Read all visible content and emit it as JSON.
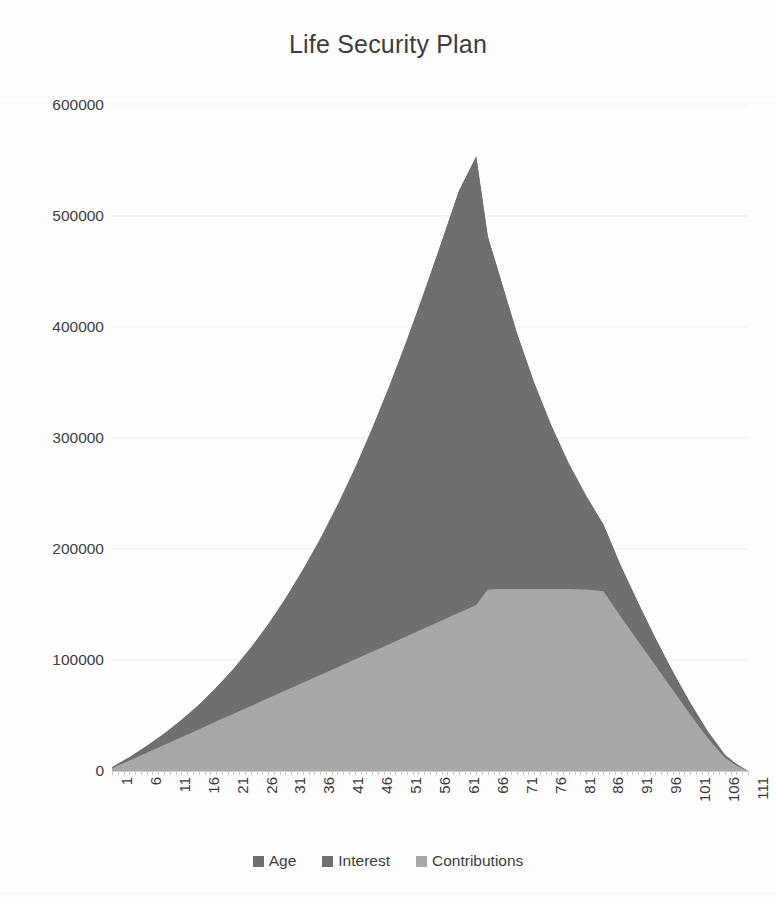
{
  "chart_data": {
    "type": "area",
    "title": "Life Security Plan",
    "xlabel": "",
    "ylabel": "",
    "stacked": true,
    "grid": true,
    "legend_position": "bottom",
    "xlim": [
      1,
      111
    ],
    "ylim": [
      0,
      600000
    ],
    "y_ticks": [
      0,
      100000,
      200000,
      300000,
      400000,
      500000,
      600000
    ],
    "y_tick_labels": [
      "0",
      "100000",
      "200000",
      "300000",
      "400000",
      "500000",
      "600000"
    ],
    "x_ticks": [
      1,
      6,
      11,
      16,
      21,
      26,
      31,
      36,
      41,
      46,
      51,
      56,
      61,
      66,
      71,
      76,
      81,
      86,
      91,
      96,
      101,
      106,
      111
    ],
    "x_tick_labels": [
      "1",
      "6",
      "11",
      "16",
      "21",
      "26",
      "31",
      "36",
      "41",
      "46",
      "51",
      "56",
      "61",
      "66",
      "71",
      "76",
      "81",
      "86",
      "91",
      "96",
      "101",
      "106",
      "111"
    ],
    "categories": [
      1,
      4,
      7,
      10,
      13,
      16,
      19,
      22,
      25,
      28,
      31,
      34,
      37,
      40,
      43,
      46,
      49,
      52,
      55,
      58,
      61,
      64,
      66,
      68,
      71,
      74,
      77,
      80,
      83,
      86,
      89,
      92,
      95,
      98,
      101,
      104,
      107,
      109,
      111
    ],
    "series": [
      {
        "name": "Age",
        "color": "#6f6f6f",
        "values": [
          0,
          0,
          0,
          0,
          0,
          0,
          0,
          0,
          0,
          0,
          0,
          0,
          0,
          0,
          0,
          0,
          0,
          0,
          0,
          0,
          0,
          0,
          0,
          0,
          0,
          0,
          0,
          0,
          0,
          0,
          0,
          0,
          0,
          0,
          0,
          0,
          0,
          0,
          0
        ]
      },
      {
        "name": "Interest",
        "color": "#6f6f6f",
        "values": [
          900,
          3000,
          6000,
          10000,
          15500,
          22000,
          30500,
          40500,
          52500,
          66500,
          83000,
          101500,
          122500,
          146000,
          172000,
          201000,
          232500,
          266500,
          303000,
          341000,
          380000,
          404000,
          318000,
          283000,
          231000,
          186000,
          147000,
          113000,
          84500,
          60000,
          46000,
          34500,
          24500,
          16500,
          10500,
          6000,
          2600,
          1200,
          0
        ]
      },
      {
        "name": "Contributions",
        "color": "#a8a8a8",
        "values": [
          2500,
          9500,
          16500,
          23500,
          30500,
          37500,
          44500,
          51500,
          58500,
          65500,
          72500,
          79500,
          86500,
          93500,
          100500,
          107500,
          114500,
          121500,
          128500,
          135500,
          142500,
          149500,
          163500,
          164000,
          164000,
          164000,
          164000,
          164000,
          163500,
          162000,
          139000,
          117000,
          95000,
          73000,
          51000,
          30000,
          12000,
          5000,
          0
        ]
      }
    ],
    "peak": {
      "age": 66,
      "total": 482000
    },
    "contributions_plateau": 164000
  },
  "legend": {
    "items": [
      {
        "label": "Age",
        "color": "#6f6f6f"
      },
      {
        "label": "Interest",
        "color": "#6f6f6f"
      },
      {
        "label": "Contributions",
        "color": "#a8a8a8"
      }
    ]
  },
  "colors": {
    "age": "#6f6f6f",
    "interest": "#6f6f6f",
    "contributions": "#a8a8a8",
    "gridline": "#ededed",
    "axis": "#d2d2d2",
    "text": "#3d3d3d",
    "background": "#fdfdfd"
  }
}
